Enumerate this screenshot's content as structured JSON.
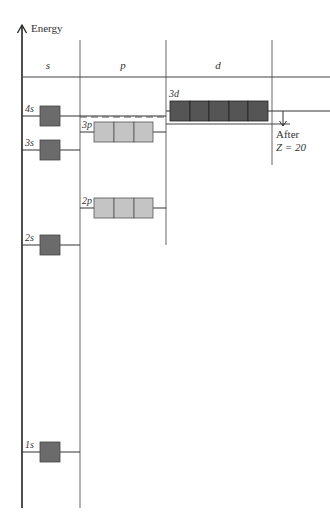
{
  "axis": {
    "label": "Energy"
  },
  "columns": [
    {
      "id": "s",
      "label": "s"
    },
    {
      "id": "p",
      "label": "p"
    },
    {
      "id": "d",
      "label": "d"
    }
  ],
  "levels": [
    {
      "id": "1s",
      "label": "1s",
      "subshell": "s",
      "orbitals": 1
    },
    {
      "id": "2s",
      "label": "2s",
      "subshell": "s",
      "orbitals": 1
    },
    {
      "id": "2p",
      "label": "2p",
      "subshell": "p",
      "orbitals": 3
    },
    {
      "id": "3s",
      "label": "3s",
      "subshell": "s",
      "orbitals": 1
    },
    {
      "id": "3p",
      "label": "3p",
      "subshell": "p",
      "orbitals": 3
    },
    {
      "id": "4s",
      "label": "4s",
      "subshell": "s",
      "orbitals": 1
    },
    {
      "id": "3d",
      "label": "3d",
      "subshell": "d",
      "orbitals": 5
    }
  ],
  "annotation": {
    "line1": "After",
    "line2": "Z = 20"
  },
  "colors": {
    "s_box": "#6b6b6b",
    "p_box": "#c4c4c4",
    "d_box": "#555555",
    "lines": "#333333"
  }
}
